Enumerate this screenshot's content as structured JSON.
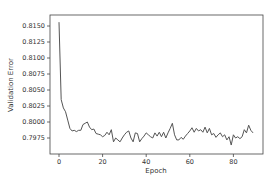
{
  "chart_data": {
    "type": "line",
    "title": "",
    "xlabel": "Epoch",
    "ylabel": "Validation Error",
    "xlim": [
      -4.2,
      93.2
    ],
    "ylim": [
      0.79575,
      0.81617
    ],
    "xticks": [
      0,
      20,
      40,
      60,
      80
    ],
    "xtick_labels": [
      "0",
      "20",
      "40",
      "60",
      "80"
    ],
    "yticks": [
      0.7975,
      0.8,
      0.8025,
      0.805,
      0.8075,
      0.81,
      0.8125,
      0.815
    ],
    "ytick_labels": [
      "0.7975",
      "0.8000",
      "0.8025",
      "0.8050",
      "0.8075",
      "0.8100",
      "0.8125",
      "0.8150"
    ],
    "grid": false,
    "legend": null,
    "series": [
      {
        "name": "Validation Error",
        "color": "#555555",
        "x": [
          0,
          1,
          2,
          3,
          4,
          5,
          6,
          7,
          8,
          9,
          10,
          11,
          12,
          13,
          14,
          15,
          16,
          17,
          18,
          19,
          20,
          21,
          22,
          23,
          24,
          25,
          26,
          27,
          28,
          29,
          30,
          31,
          32,
          33,
          34,
          35,
          36,
          37,
          38,
          39,
          40,
          41,
          42,
          43,
          44,
          45,
          46,
          47,
          48,
          49,
          50,
          51,
          52,
          53,
          54,
          55,
          56,
          57,
          58,
          59,
          60,
          61,
          62,
          63,
          64,
          65,
          66,
          67,
          68,
          69,
          70,
          71,
          72,
          73,
          74,
          75,
          76,
          77,
          78,
          79,
          80,
          81,
          82,
          83,
          84,
          85,
          86,
          87,
          88,
          89
        ],
        "values": [
          0.8156,
          0.8035,
          0.8022,
          0.8016,
          0.8003,
          0.799,
          0.7986,
          0.7987,
          0.7985,
          0.7987,
          0.7987,
          0.7996,
          0.7998,
          0.8,
          0.7992,
          0.7988,
          0.7989,
          0.7982,
          0.7981,
          0.798,
          0.7977,
          0.7979,
          0.7984,
          0.798,
          0.7988,
          0.7969,
          0.7975,
          0.7972,
          0.7969,
          0.7975,
          0.798,
          0.7984,
          0.7986,
          0.7975,
          0.7969,
          0.7983,
          0.7982,
          0.7969,
          0.7974,
          0.7978,
          0.7983,
          0.798,
          0.7977,
          0.7975,
          0.7983,
          0.7978,
          0.7984,
          0.7977,
          0.7984,
          0.7975,
          0.7983,
          0.799,
          0.7998,
          0.798,
          0.7972,
          0.7972,
          0.7976,
          0.7973,
          0.7978,
          0.7982,
          0.7986,
          0.7991,
          0.7984,
          0.799,
          0.7986,
          0.7988,
          0.7984,
          0.7992,
          0.7983,
          0.799,
          0.798,
          0.7982,
          0.7976,
          0.798,
          0.7983,
          0.7977,
          0.798,
          0.7972,
          0.7977,
          0.7964,
          0.798,
          0.7975,
          0.7977,
          0.7974,
          0.7977,
          0.7988,
          0.7983,
          0.7995,
          0.7987,
          0.7983
        ]
      }
    ]
  },
  "layout": {
    "plot_area": {
      "left": 50,
      "top": 15,
      "right": 263,
      "bottom": 154
    },
    "x_px": {
      "origin": 59,
      "per_unit": 2.18
    },
    "y_px": {
      "ref_value": 0.815,
      "ref_px": 26,
      "per_unit": 6400
    }
  },
  "colors": {
    "line": "#555555",
    "frame": "#444444",
    "text": "#333333",
    "background": "#ffffff"
  }
}
